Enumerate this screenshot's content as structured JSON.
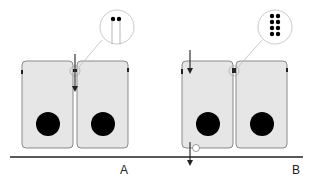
{
  "panels": [
    {
      "id": "A",
      "label": "A",
      "junction_type": "single tight junction (two dots)",
      "arrows": [
        "paracellular-down"
      ]
    },
    {
      "id": "B",
      "label": "B",
      "junction_type": "multiple tight junction strands (eight dots)",
      "arrows": [
        "apical-entry",
        "basal-exit"
      ]
    }
  ],
  "colors": {
    "cell_fill": "#e6e6e6",
    "cell_stroke": "#8a8a8a",
    "nucleus": "#000000",
    "baseline": "#222222",
    "callout": "#bbbbbb"
  }
}
